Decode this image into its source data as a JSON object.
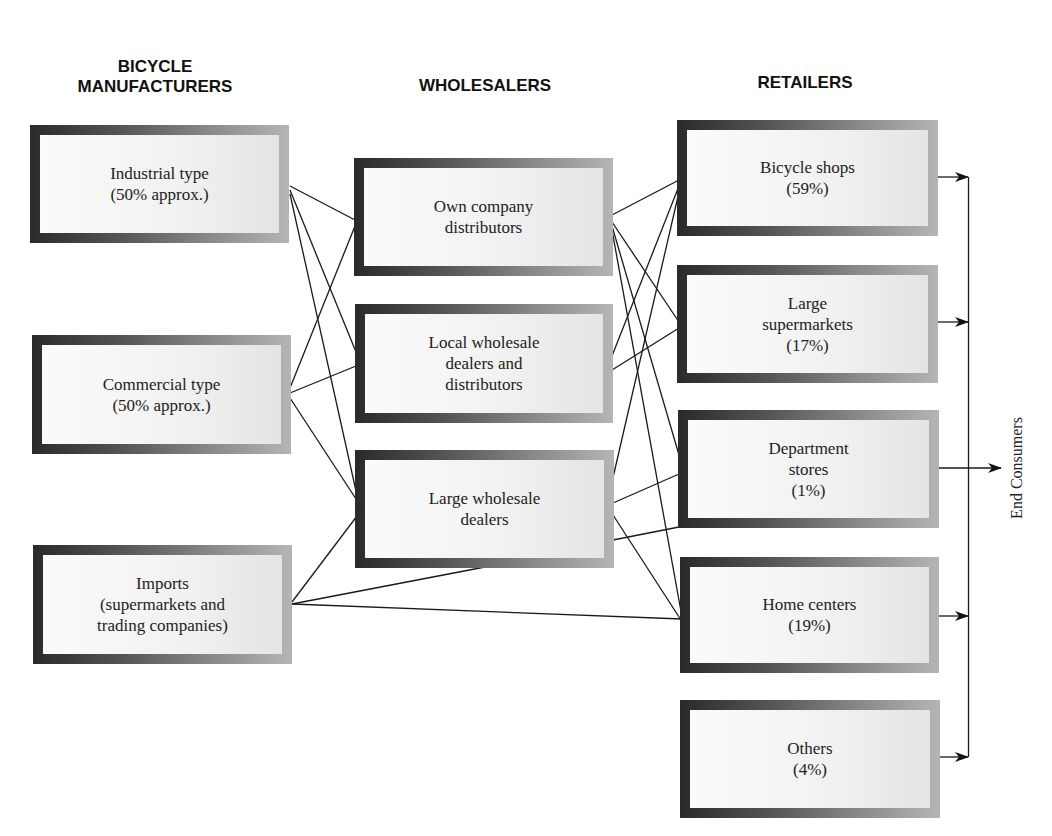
{
  "headers": {
    "manufacturers": [
      "BICYCLE",
      "MANUFACTURERS"
    ],
    "wholesalers": "WHOLESALERS",
    "retailers": "RETAILERS"
  },
  "manufacturers": [
    {
      "lines": [
        "Industrial type",
        "(50% approx.)"
      ]
    },
    {
      "lines": [
        "Commercial type",
        "(50% approx.)"
      ]
    },
    {
      "lines": [
        "Imports",
        "(supermarkets and",
        "trading companies)"
      ]
    }
  ],
  "wholesalers": [
    {
      "lines": [
        "Own company",
        "distributors"
      ]
    },
    {
      "lines": [
        "Local wholesale",
        "dealers and",
        "distributors"
      ]
    },
    {
      "lines": [
        "Large wholesale",
        "dealers"
      ]
    }
  ],
  "retailers": [
    {
      "lines": [
        "Bicycle shops",
        "(59%)"
      ]
    },
    {
      "lines": [
        "Large",
        "supermarkets",
        "(17%)"
      ]
    },
    {
      "lines": [
        "Department",
        "stores",
        "(1%)"
      ]
    },
    {
      "lines": [
        "Home centers",
        "(19%)"
      ]
    },
    {
      "lines": [
        "Others",
        "(4%)"
      ]
    }
  ],
  "end_consumers": "End Consumers"
}
